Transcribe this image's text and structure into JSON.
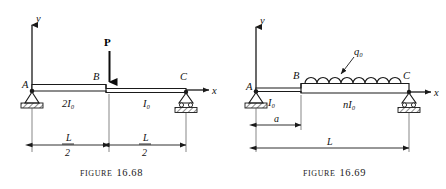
{
  "page": {
    "background_color": "#ffffff",
    "line_color": "#1a1a1a",
    "width": 446,
    "height": 189
  },
  "figures": [
    {
      "id": "figure-16-68",
      "caption_word": "Figure",
      "caption_number": "16.68",
      "axes": {
        "y_label": "y",
        "x_label": "x"
      },
      "node_labels": {
        "left": "A",
        "middle": "B",
        "right": "C"
      },
      "section_labels": {
        "left_segment": "2I₀",
        "right_segment": "I₀"
      },
      "load": {
        "type": "point-load",
        "label": "P",
        "direction": "down",
        "position": "midspan-at-B"
      },
      "dimensions": [
        {
          "name": "left-half-span",
          "numerator": "L",
          "denominator": "2"
        },
        {
          "name": "right-half-span",
          "numerator": "L",
          "denominator": "2"
        }
      ],
      "supports": [
        {
          "at": "A",
          "type": "pin-support"
        },
        {
          "at": "C",
          "type": "roller-support"
        }
      ]
    },
    {
      "id": "figure-16-69",
      "caption_word": "Figure",
      "caption_number": "16.69",
      "axes": {
        "y_label": "y",
        "x_label": "x"
      },
      "node_labels": {
        "left": "A",
        "middle": "B",
        "right": "C"
      },
      "section_labels": {
        "left_segment": "I₀",
        "right_segment": "nI₀"
      },
      "load": {
        "type": "distributed-load",
        "label": "q₀",
        "arcs": 9,
        "span": "B-to-C"
      },
      "dimensions": [
        {
          "name": "distance-a",
          "label": "a"
        },
        {
          "name": "total-span",
          "label": "L"
        }
      ],
      "supports": [
        {
          "at": "A",
          "type": "pin-support"
        },
        {
          "at": "C",
          "type": "roller-support"
        }
      ]
    }
  ]
}
